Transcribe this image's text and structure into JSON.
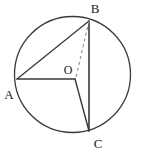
{
  "figure": {
    "kind": "circle-geometry-diagram",
    "width": 143,
    "height": 155,
    "background_color": "#ffffff",
    "border_color": "#d9d9d9",
    "stroke_color": "#3a3a3a",
    "dashed_stroke_color": "#8a8a8a",
    "label_color": "#1a1a1a"
  },
  "circle": {
    "name": "main-circle",
    "cx": 72.5,
    "cy": 74.5,
    "r": 58,
    "stroke_width": 1.3
  },
  "points": {
    "A": {
      "label": "A",
      "x": 17,
      "y": 79,
      "label_x": 9,
      "label_y": 99
    },
    "B": {
      "label": "B",
      "x": 89,
      "y": 21,
      "label_x": 95,
      "label_y": 13
    },
    "C": {
      "label": "C",
      "x": 89,
      "y": 131,
      "label_x": 98,
      "label_y": 148
    },
    "O": {
      "label": "O",
      "x": 75,
      "y": 79,
      "label_x": 64,
      "label_y": 74
    }
  },
  "segments": [
    {
      "name": "segment-AB",
      "from": "A",
      "to": "B",
      "style": "solid",
      "stroke_width": 1.3
    },
    {
      "name": "segment-AO",
      "from": "A",
      "to": "O",
      "style": "solid",
      "stroke_width": 1.4
    },
    {
      "name": "segment-OC",
      "from": "O",
      "to": "C",
      "style": "solid",
      "stroke_width": 1.4
    },
    {
      "name": "segment-BC",
      "from": "B",
      "to": "C",
      "style": "solid",
      "stroke_width": 1.6
    },
    {
      "name": "segment-BO",
      "from": "B",
      "to": "O",
      "style": "dashed",
      "stroke_width": 1.1,
      "dash_pattern": "3,3"
    }
  ]
}
